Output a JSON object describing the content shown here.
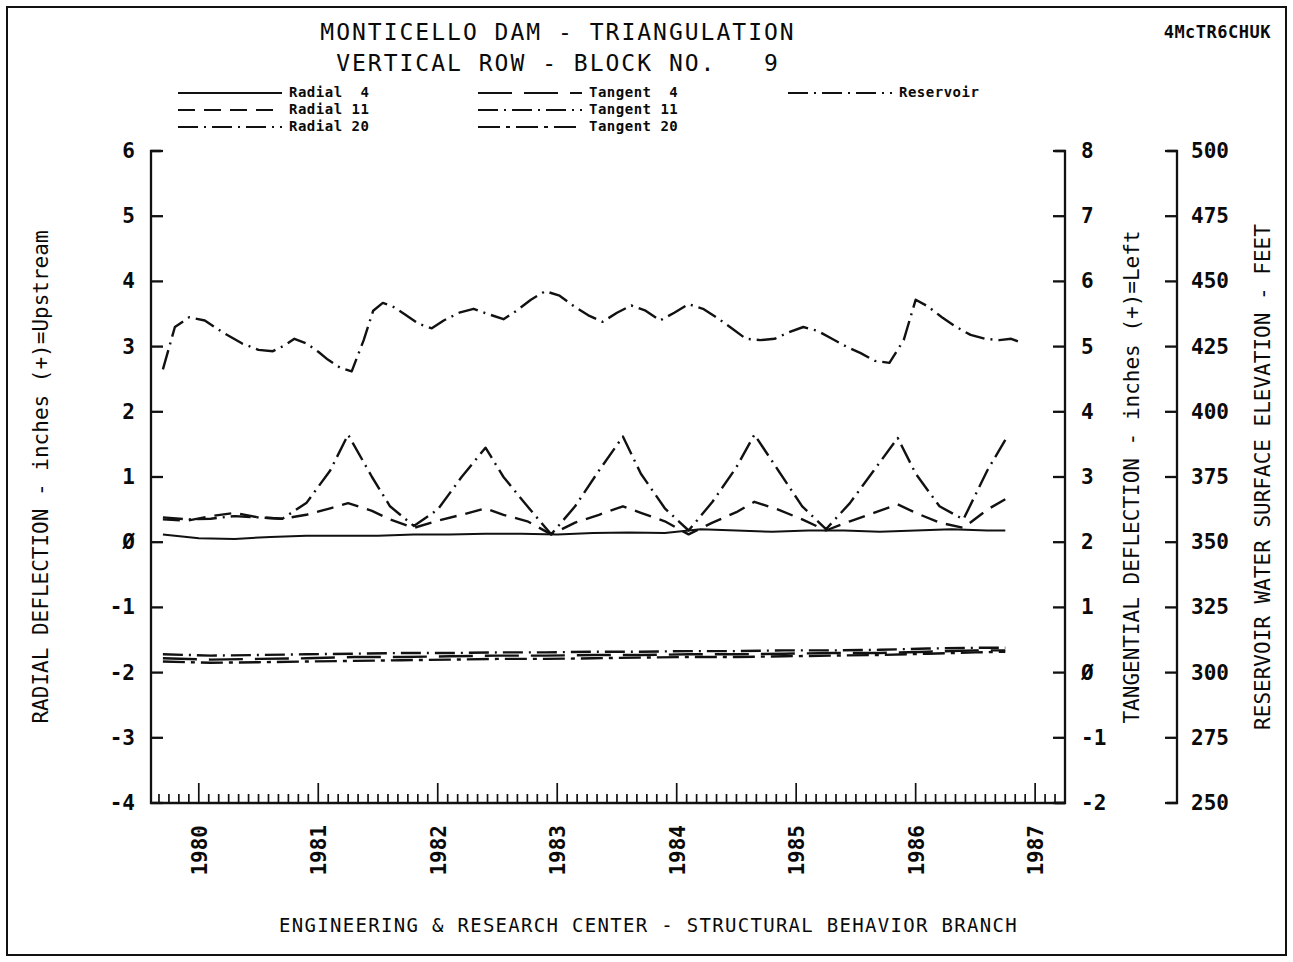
{
  "header": {
    "title_line1": "MONTICELLO DAM - TRIANGULATION",
    "title_line2": "VERTICAL ROW - BLOCK NO.   9",
    "corner_code": "4McTR6CHUK"
  },
  "footer": {
    "text": "ENGINEERING & RESEARCH CENTER - STRUCTURAL BEHAVIOR BRANCH"
  },
  "legend": {
    "columns": [
      {
        "items": [
          {
            "label": "Radial  4",
            "style": "solid"
          },
          {
            "label": "Radial 11",
            "style": "dashed"
          },
          {
            "label": "Radial 20",
            "style": "dashdot"
          }
        ]
      },
      {
        "items": [
          {
            "label": "Tangent  4",
            "style": "dashed-long"
          },
          {
            "label": "Tangent 11",
            "style": "dashdot"
          },
          {
            "label": "Tangent 20",
            "style": "dashdot2"
          }
        ]
      },
      {
        "items": [
          {
            "label": "Reservoir",
            "style": "dashdot"
          }
        ]
      }
    ]
  },
  "chart_data": {
    "type": "line",
    "xlabel": "",
    "x_tick_labels": [
      "1980",
      "1981",
      "1982",
      "1983",
      "1984",
      "1985",
      "1986",
      "1987"
    ],
    "x_tick_values": [
      1980,
      1981,
      1982,
      1983,
      1984,
      1985,
      1986,
      1987
    ],
    "xlim": [
      1979.6,
      1987.25
    ],
    "x_minor_ticks_per_year": 12,
    "grid": false,
    "legend_position": "top",
    "axes": [
      {
        "id": "radial",
        "side": "left",
        "label": "RADIAL DEFLECTION - inches (+)=Upstream",
        "ticks": [
          6,
          5,
          4,
          3,
          2,
          1,
          0,
          -1,
          -2,
          -3,
          -4
        ],
        "tick_labels": [
          "6",
          "5",
          "4",
          "3",
          "2",
          "1",
          "Ø",
          "-1",
          "-2",
          "-3",
          "-4"
        ],
        "ylim": [
          -4,
          6
        ]
      },
      {
        "id": "tangential",
        "side": "right",
        "label": "TANGENTIAL DEFLECTION - inches (+)=Left",
        "ticks": [
          8,
          7,
          6,
          5,
          4,
          3,
          2,
          1,
          0,
          -1,
          -2
        ],
        "tick_labels": [
          "8",
          "7",
          "6",
          "5",
          "4",
          "3",
          "2",
          "1",
          "Ø",
          "-1",
          "-2"
        ],
        "ylim": [
          -2,
          8
        ]
      },
      {
        "id": "reservoir",
        "side": "right-outer",
        "label": "RESERVOIR WATER SURFACE ELEVATION - FEET",
        "ticks": [
          500,
          475,
          450,
          425,
          400,
          375,
          350,
          325,
          300,
          275,
          250
        ],
        "tick_labels": [
          "500",
          "475",
          "450",
          "425",
          "400",
          "375",
          "350",
          "325",
          "300",
          "275",
          "250"
        ],
        "ylim": [
          250,
          500
        ]
      }
    ],
    "series": [
      {
        "name": "Reservoir",
        "axis": "reservoir",
        "style": "dashdot",
        "x": [
          1979.7,
          1979.8,
          1979.92,
          1980.05,
          1980.2,
          1980.36,
          1980.5,
          1980.62,
          1980.72,
          1980.8,
          1980.9,
          1981.0,
          1981.08,
          1981.18,
          1981.28,
          1981.38,
          1981.46,
          1981.54,
          1981.62,
          1981.72,
          1981.84,
          1981.95,
          1982.05,
          1982.18,
          1982.3,
          1982.42,
          1982.55,
          1982.66,
          1982.78,
          1982.9,
          1983.02,
          1983.14,
          1983.26,
          1983.38,
          1983.5,
          1983.62,
          1983.74,
          1983.86,
          1983.98,
          1984.1,
          1984.22,
          1984.34,
          1984.46,
          1984.58,
          1984.7,
          1984.82,
          1984.94,
          1985.06,
          1985.18,
          1985.3,
          1985.42,
          1985.54,
          1985.66,
          1985.78,
          1985.9,
          1986.0,
          1986.1,
          1986.22,
          1986.34,
          1986.46,
          1986.58,
          1986.7,
          1986.8,
          1986.9
        ],
        "y_radial_equiv": [
          2.65,
          3.3,
          3.45,
          3.4,
          3.22,
          3.05,
          2.95,
          2.93,
          3.02,
          3.12,
          3.05,
          2.92,
          2.8,
          2.68,
          2.62,
          3.1,
          3.55,
          3.67,
          3.62,
          3.5,
          3.35,
          3.28,
          3.4,
          3.52,
          3.58,
          3.5,
          3.42,
          3.55,
          3.72,
          3.85,
          3.78,
          3.62,
          3.48,
          3.38,
          3.52,
          3.63,
          3.55,
          3.4,
          3.52,
          3.65,
          3.58,
          3.44,
          3.28,
          3.12,
          3.1,
          3.12,
          3.22,
          3.3,
          3.24,
          3.12,
          3.0,
          2.9,
          2.78,
          2.75,
          3.1,
          3.72,
          3.62,
          3.45,
          3.3,
          3.18,
          3.12,
          3.1,
          3.12,
          3.05
        ],
        "y": [
          416,
          432,
          436,
          435,
          430,
          426,
          424,
          423,
          425,
          428,
          426,
          423,
          420,
          417,
          415,
          427,
          439,
          442,
          440,
          437,
          434,
          432,
          435,
          438,
          440,
          437,
          435,
          439,
          443,
          446,
          444,
          440,
          437,
          434,
          438,
          441,
          439,
          435,
          438,
          441,
          440,
          436,
          432,
          428,
          427,
          428,
          430,
          432,
          431,
          428,
          425,
          422,
          419,
          419,
          427,
          443,
          440,
          436,
          432,
          430,
          428,
          427,
          428,
          426
        ]
      },
      {
        "name": "Radial 20",
        "axis": "radial",
        "style": "dashdot",
        "x": [
          1979.7,
          1979.9,
          1980.1,
          1980.3,
          1980.5,
          1980.7,
          1980.9,
          1981.1,
          1981.25,
          1981.45,
          1981.6,
          1981.8,
          1982.0,
          1982.2,
          1982.4,
          1982.55,
          1982.75,
          1982.95,
          1983.15,
          1983.35,
          1983.55,
          1983.7,
          1983.9,
          1984.1,
          1984.3,
          1984.5,
          1984.65,
          1984.85,
          1985.05,
          1985.25,
          1985.45,
          1985.65,
          1985.85,
          1986.0,
          1986.2,
          1986.4,
          1986.6,
          1986.75
        ],
        "y": [
          0.38,
          0.35,
          0.36,
          0.4,
          0.38,
          0.36,
          0.6,
          1.1,
          1.65,
          1.0,
          0.55,
          0.25,
          0.5,
          1.0,
          1.45,
          1.0,
          0.55,
          0.12,
          0.55,
          1.1,
          1.62,
          1.05,
          0.52,
          0.18,
          0.62,
          1.15,
          1.65,
          1.1,
          0.55,
          0.2,
          0.6,
          1.1,
          1.6,
          1.05,
          0.55,
          0.35,
          1.1,
          1.57
        ]
      },
      {
        "name": "Radial 11",
        "axis": "radial",
        "style": "dashed",
        "x": [
          1979.7,
          1979.9,
          1980.1,
          1980.3,
          1980.5,
          1980.7,
          1980.9,
          1981.1,
          1981.25,
          1981.45,
          1981.6,
          1981.8,
          1982.0,
          1982.2,
          1982.4,
          1982.55,
          1982.75,
          1982.95,
          1983.15,
          1983.35,
          1983.55,
          1983.7,
          1983.9,
          1984.1,
          1984.3,
          1984.5,
          1984.65,
          1984.85,
          1985.05,
          1985.25,
          1985.45,
          1985.65,
          1985.85,
          1986.0,
          1986.2,
          1986.4,
          1986.6,
          1986.75
        ],
        "y": [
          0.35,
          0.33,
          0.4,
          0.45,
          0.38,
          0.36,
          0.42,
          0.52,
          0.6,
          0.48,
          0.35,
          0.22,
          0.33,
          0.42,
          0.52,
          0.42,
          0.32,
          0.12,
          0.3,
          0.42,
          0.55,
          0.45,
          0.32,
          0.12,
          0.3,
          0.46,
          0.62,
          0.5,
          0.35,
          0.18,
          0.32,
          0.45,
          0.58,
          0.45,
          0.3,
          0.22,
          0.5,
          0.66
        ]
      },
      {
        "name": "Radial 4",
        "axis": "radial",
        "style": "solid",
        "x": [
          1979.7,
          1980.0,
          1980.3,
          1980.6,
          1980.9,
          1981.2,
          1981.5,
          1981.8,
          1982.1,
          1982.4,
          1982.7,
          1983.0,
          1983.3,
          1983.6,
          1983.9,
          1984.2,
          1984.5,
          1984.8,
          1985.1,
          1985.4,
          1985.7,
          1986.0,
          1986.3,
          1986.6,
          1986.75
        ],
        "y": [
          0.12,
          0.06,
          0.05,
          0.08,
          0.1,
          0.1,
          0.1,
          0.12,
          0.12,
          0.13,
          0.13,
          0.12,
          0.14,
          0.15,
          0.14,
          0.2,
          0.18,
          0.16,
          0.18,
          0.18,
          0.16,
          0.18,
          0.2,
          0.18,
          0.18
        ]
      },
      {
        "name": "Tangent 4",
        "axis": "radial",
        "style": "dashed-long",
        "x": [
          1979.7,
          1980.1,
          1980.5,
          1980.9,
          1981.3,
          1981.7,
          1982.1,
          1982.5,
          1982.9,
          1983.3,
          1983.7,
          1984.1,
          1984.5,
          1984.9,
          1985.3,
          1985.7,
          1986.1,
          1986.5,
          1986.75
        ],
        "y": [
          -1.78,
          -1.8,
          -1.79,
          -1.78,
          -1.76,
          -1.76,
          -1.75,
          -1.74,
          -1.74,
          -1.73,
          -1.73,
          -1.72,
          -1.72,
          -1.71,
          -1.7,
          -1.7,
          -1.68,
          -1.66,
          -1.66
        ]
      },
      {
        "name": "Tangent 11",
        "axis": "radial",
        "style": "dashdot",
        "x": [
          1979.7,
          1980.1,
          1980.5,
          1980.9,
          1981.3,
          1981.7,
          1982.1,
          1982.5,
          1982.9,
          1983.3,
          1983.7,
          1984.1,
          1984.5,
          1984.9,
          1985.3,
          1985.7,
          1986.1,
          1986.5,
          1986.75
        ],
        "y": [
          -1.72,
          -1.74,
          -1.73,
          -1.72,
          -1.71,
          -1.7,
          -1.7,
          -1.69,
          -1.69,
          -1.68,
          -1.68,
          -1.67,
          -1.67,
          -1.66,
          -1.66,
          -1.65,
          -1.63,
          -1.62,
          -1.62
        ]
      },
      {
        "name": "Tangent 20",
        "axis": "radial",
        "style": "dashdot2",
        "x": [
          1979.7,
          1980.1,
          1980.5,
          1980.9,
          1981.3,
          1981.7,
          1982.1,
          1982.5,
          1982.9,
          1983.3,
          1983.7,
          1984.1,
          1984.5,
          1984.9,
          1985.3,
          1985.7,
          1986.1,
          1986.5,
          1986.75
        ],
        "y": [
          -1.83,
          -1.85,
          -1.84,
          -1.83,
          -1.82,
          -1.81,
          -1.8,
          -1.79,
          -1.79,
          -1.78,
          -1.77,
          -1.76,
          -1.76,
          -1.75,
          -1.74,
          -1.73,
          -1.71,
          -1.69,
          -1.68
        ]
      }
    ]
  }
}
